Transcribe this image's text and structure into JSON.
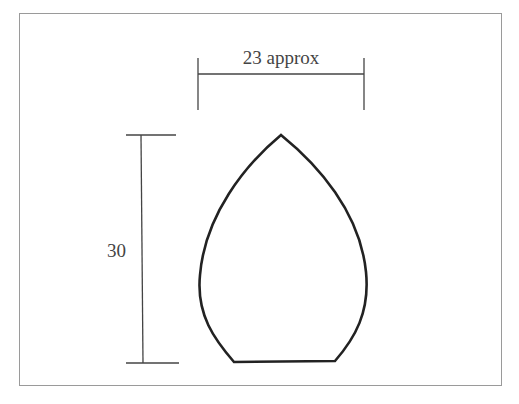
{
  "diagram": {
    "width_label": "23 approx",
    "height_label": "30",
    "shape": "pointed-arch (ogee/gothic leaf) outline with flat base",
    "colors": {
      "line": "#222222",
      "dim_line": "#444444",
      "frame": "#9a9a9a"
    }
  }
}
